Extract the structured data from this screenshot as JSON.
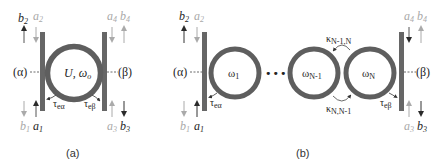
{
  "colors": {
    "ring": "#5e5e5e",
    "waveguide": "#666666",
    "dark_text": "#1e1e1e",
    "grey_text": "#a9a9a9",
    "arrow_dark": "#2a2a2a",
    "arrow_grey": "#aaaaaa"
  },
  "panel_a": {
    "caption": "(a)",
    "port_left": "(α)",
    "port_right": "(β)",
    "ring_label": "U, ω",
    "ring_label_sub": "o",
    "top_labels": [
      {
        "base": "b",
        "sub": "2",
        "tone": "dark"
      },
      {
        "base": "a",
        "sub": "2",
        "tone": "grey"
      },
      {
        "base": "a",
        "sub": "4",
        "tone": "grey"
      },
      {
        "base": "b",
        "sub": "4",
        "tone": "grey"
      }
    ],
    "bottom_labels": [
      {
        "base": "b",
        "sub": "1",
        "tone": "grey"
      },
      {
        "base": "a",
        "sub": "1",
        "tone": "dark"
      },
      {
        "base": "a",
        "sub": "3",
        "tone": "grey"
      },
      {
        "base": "b",
        "sub": "3",
        "tone": "dark"
      }
    ],
    "tau_left": {
      "base": "τ",
      "sub": "eα"
    },
    "tau_right": {
      "base": "τ",
      "sub": "eβ"
    }
  },
  "panel_b": {
    "caption": "(b)",
    "port_left": "(α)",
    "port_right": "(β)",
    "rings": [
      {
        "base": "ω",
        "sub": "1"
      },
      {
        "base": "ω",
        "sub": "N-1"
      },
      {
        "base": "ω",
        "sub": "N"
      }
    ],
    "ellipsis": "•••",
    "coupling_top": {
      "base": "κ",
      "sub": "N-1,N"
    },
    "coupling_bottom": {
      "base": "κ",
      "sub": "N,N-1"
    },
    "top_labels": [
      {
        "base": "b",
        "sub": "2",
        "tone": "dark"
      },
      {
        "base": "a",
        "sub": "2",
        "tone": "grey"
      },
      {
        "base": "a",
        "sub": "4",
        "tone": "grey"
      },
      {
        "base": "b",
        "sub": "4",
        "tone": "grey"
      }
    ],
    "bottom_labels": [
      {
        "base": "b",
        "sub": "1",
        "tone": "grey"
      },
      {
        "base": "a",
        "sub": "1",
        "tone": "dark"
      },
      {
        "base": "a",
        "sub": "3",
        "tone": "grey"
      },
      {
        "base": "b",
        "sub": "3",
        "tone": "dark"
      }
    ],
    "tau_left": {
      "base": "τ",
      "sub": "eα"
    },
    "tau_right": {
      "base": "τ",
      "sub": "eβ"
    }
  }
}
